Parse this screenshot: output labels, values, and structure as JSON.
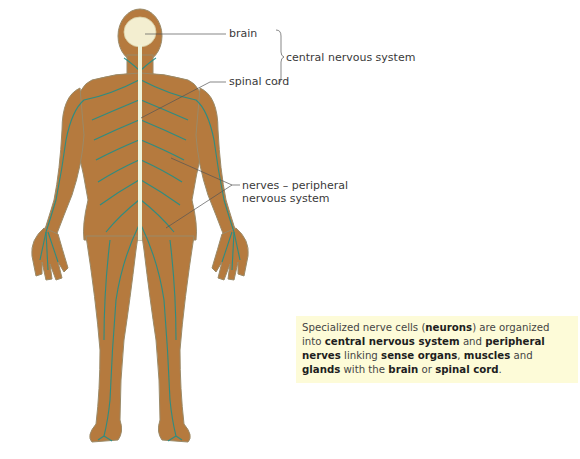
{
  "labels": {
    "brain": "brain",
    "spinal_cord": "spinal cord",
    "cns": "central nervous system",
    "pns_line1": "nerves – peripheral",
    "pns_line2": "nervous system"
  },
  "caption": {
    "parts": [
      {
        "text": "Specialized nerve cells (",
        "bold": false
      },
      {
        "text": "neurons",
        "bold": true
      },
      {
        "text": ") are organized into ",
        "bold": false
      },
      {
        "text": "central nervous system",
        "bold": true
      },
      {
        "text": " and ",
        "bold": false
      },
      {
        "text": "peripheral nerves",
        "bold": true
      },
      {
        "text": " linking ",
        "bold": false
      },
      {
        "text": "sense organs",
        "bold": true
      },
      {
        "text": ", ",
        "bold": false
      },
      {
        "text": "muscles",
        "bold": true
      },
      {
        "text": " and ",
        "bold": false
      },
      {
        "text": "glands",
        "bold": true
      },
      {
        "text": " with the ",
        "bold": false
      },
      {
        "text": "brain",
        "bold": true
      },
      {
        "text": " or ",
        "bold": false
      },
      {
        "text": "spinal cord",
        "bold": true
      },
      {
        "text": ".",
        "bold": false
      }
    ]
  },
  "colors": {
    "skin": "#b57a3e",
    "skin_edge": "#8c8a6e",
    "nerves": "#1f8f8a",
    "brain": "#f3eed0",
    "spinal_cord": "#eef3da",
    "caption_bg": "#fdfbd8",
    "leader": "#555555"
  }
}
